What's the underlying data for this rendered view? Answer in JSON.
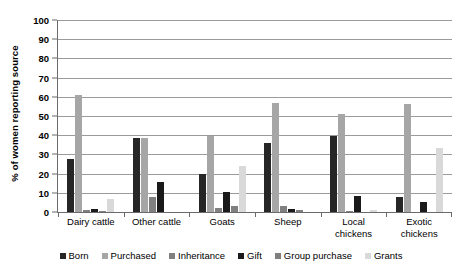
{
  "chart_data": {
    "type": "bar",
    "title": "",
    "xlabel": "",
    "ylabel": "% of women reporting source",
    "ylim": [
      0,
      100
    ],
    "ytick_step": 10,
    "yticks": [
      100,
      90,
      80,
      70,
      60,
      50,
      40,
      30,
      20,
      10,
      0
    ],
    "grid": "horizontal",
    "legend_position": "bottom",
    "categories": [
      "Dairy cattle",
      "Other cattle",
      "Goats",
      "Sheep",
      "Local chickens",
      "Exotic chickens"
    ],
    "series": [
      {
        "name": "Born",
        "color": "#262626",
        "values": [
          27.5,
          38.5,
          20,
          36,
          39.5,
          8
        ]
      },
      {
        "name": "Purchased",
        "color": "#a6a6a6",
        "values": [
          61,
          38.5,
          39.5,
          57,
          51,
          56
        ]
      },
      {
        "name": "Inheritance",
        "color": "#808080",
        "values": [
          1,
          8,
          2,
          3,
          0.5,
          0
        ]
      },
      {
        "name": "Gift",
        "color": "#1a1a1a",
        "values": [
          1.5,
          15.5,
          10.5,
          1.5,
          8.5,
          5
        ]
      },
      {
        "name": "Group purchase",
        "color": "#7f7f7f",
        "values": [
          0.5,
          0,
          3,
          1,
          0,
          0
        ]
      },
      {
        "name": "Grants",
        "color": "#d9d9d9",
        "values": [
          7,
          0,
          24,
          0,
          1,
          33.5
        ]
      }
    ]
  },
  "colors": {
    "gridline": "#9b9b9b",
    "axis": "#6b6b6b",
    "text": "#000000",
    "background": "#ffffff"
  }
}
